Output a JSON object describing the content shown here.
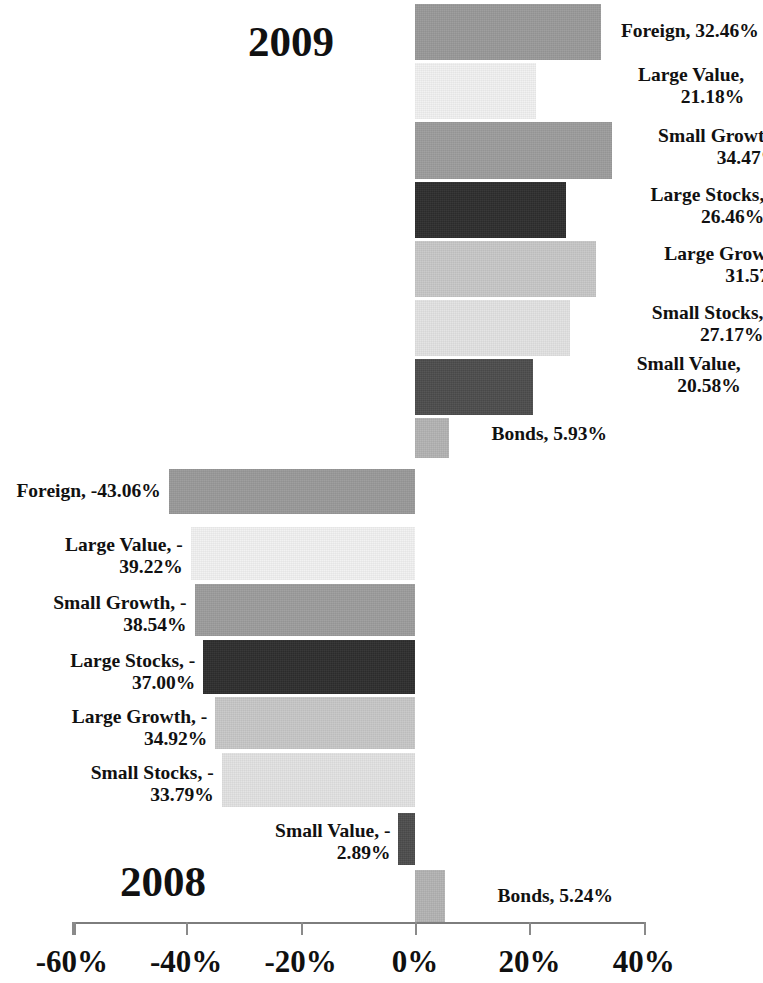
{
  "titles": {
    "top_year": "2009",
    "bottom_year": "2008"
  },
  "axis": {
    "tick_labels": [
      "-60%",
      "-40%",
      "-20%",
      "0%",
      "20%",
      "40%"
    ],
    "tick_values": [
      -60,
      -40,
      -20,
      0,
      20,
      40
    ]
  },
  "labels_2009": {
    "foreign": "Foreign, 32.46%",
    "large_value": "Large Value,\n21.18%",
    "small_growth": "Small Growth,\n34.47%",
    "large_stocks": "Large Stocks,\n26.46%",
    "large_growth": "Large Growth,\n31.57%",
    "small_stocks": "Small Stocks,\n27.17%",
    "small_value": "Small Value,\n20.58%",
    "bonds": "Bonds, 5.93%"
  },
  "labels_2008": {
    "foreign": "Foreign, -43.06%",
    "large_value": "Large Value, -\n39.22%",
    "small_growth": "Small Growth, -\n38.54%",
    "large_stocks": "Large Stocks, -\n37.00%",
    "large_growth": "Large Growth, -\n34.92%",
    "small_stocks": "Small Stocks, -\n33.79%",
    "small_value": "Small Value, -\n2.89%",
    "bonds": "Bonds, 5.24%"
  },
  "colors": {
    "foreign": "#9a9a9a",
    "large_value": "#f2f2f2",
    "small_growth": "#9d9d9d",
    "large_stocks": "#2e2e2e",
    "large_growth": "#c8c8c8",
    "small_stocks": "#e3e3e3",
    "small_value": "#4d4d4d",
    "bonds": "#b4b4b4",
    "axis": "#8a8a8a",
    "text": "#111111",
    "background": "#ffffff"
  },
  "chart_data": {
    "type": "bar",
    "title": "",
    "xlabel": "",
    "ylabel": "",
    "orientation": "horizontal",
    "xlim": [
      -60,
      40
    ],
    "xticks": [
      -60,
      -40,
      -20,
      0,
      20,
      40
    ],
    "xtick_labels": [
      "-60%",
      "-40%",
      "-20%",
      "0%",
      "20%",
      "40%"
    ],
    "grid": false,
    "legend": "none (labels attached to bars)",
    "groups": [
      {
        "name": "2009",
        "categories": [
          "Foreign",
          "Large Value",
          "Small Growth",
          "Large Stocks",
          "Large Growth",
          "Small Stocks",
          "Small Value",
          "Bonds"
        ],
        "values": [
          32.46,
          21.18,
          34.47,
          26.46,
          31.57,
          27.17,
          20.58,
          5.93
        ]
      },
      {
        "name": "2008",
        "categories": [
          "Foreign",
          "Large Value",
          "Small Growth",
          "Large Stocks",
          "Large Growth",
          "Small Stocks",
          "Small Value",
          "Bonds"
        ],
        "values": [
          -43.06,
          -39.22,
          -38.54,
          -37.0,
          -34.92,
          -33.79,
          -2.89,
          5.24
        ]
      }
    ]
  },
  "bars": [
    {
      "key": "b0",
      "group": "2009",
      "category": "Foreign",
      "value": 32.46,
      "top": 4,
      "height": 56,
      "color": "#9a9a9a",
      "label_key": "labels_2009.foreign",
      "label_side": "right",
      "label_top": 20,
      "label_width": 150
    },
    {
      "key": "b1",
      "group": "2009",
      "category": "Large Value",
      "value": 21.18,
      "top": 63,
      "height": 56,
      "color": "#f2f2f2",
      "label_key": "labels_2009.large_value",
      "label_side": "right",
      "label_top": 64,
      "label_width": 200
    },
    {
      "key": "b2",
      "group": "2009",
      "category": "Small Growth",
      "value": 34.47,
      "top": 122,
      "height": 57,
      "color": "#9d9d9d",
      "label_key": "labels_2009.small_growth",
      "label_side": "right",
      "label_top": 125,
      "label_width": 160
    },
    {
      "key": "b3",
      "group": "2009",
      "category": "Large Stocks",
      "value": 26.46,
      "top": 182,
      "height": 56,
      "color": "#2e2e2e",
      "label_key": "labels_2009.large_stocks",
      "label_side": "right",
      "label_top": 184,
      "label_width": 190
    },
    {
      "key": "b4",
      "group": "2009",
      "category": "Large Growth",
      "value": 31.57,
      "top": 241,
      "height": 56,
      "color": "#c8c8c8",
      "label_key": "labels_2009.large_growth",
      "label_side": "right",
      "label_top": 243,
      "label_width": 185
    },
    {
      "key": "b5",
      "group": "2009",
      "category": "Small Stocks",
      "value": 27.17,
      "top": 300,
      "height": 56,
      "color": "#e3e3e3",
      "label_key": "labels_2009.small_stocks",
      "label_side": "right",
      "label_top": 302,
      "label_width": 185
    },
    {
      "key": "b6",
      "group": "2009",
      "category": "Small Value",
      "value": 20.58,
      "top": 359,
      "height": 56,
      "color": "#4d4d4d",
      "label_key": "labels_2009.small_value",
      "label_side": "right",
      "label_top": 353,
      "label_width": 200
    },
    {
      "key": "b7",
      "group": "2009",
      "category": "Bonds",
      "value": 5.93,
      "top": 418,
      "height": 40,
      "color": "#b4b4b4",
      "label_key": "labels_2009.bonds",
      "label_side": "right",
      "label_top": 423,
      "label_width": 150
    },
    {
      "key": "b8",
      "group": "2008",
      "category": "Foreign",
      "value": -43.06,
      "top": 469,
      "height": 45,
      "color": "#9a9a9a",
      "label_key": "labels_2008.foreign",
      "label_side": "left",
      "label_top": 480,
      "label_width": 168
    },
    {
      "key": "b9",
      "group": "2008",
      "category": "Large Value",
      "value": -39.22,
      "top": 527,
      "height": 53,
      "color": "#f2f2f2",
      "label_key": "labels_2008.large_value",
      "label_side": "left",
      "label_top": 534,
      "label_width": 175
    },
    {
      "key": "b10",
      "group": "2008",
      "category": "Small Growth",
      "value": -38.54,
      "top": 584,
      "height": 52,
      "color": "#9d9d9d",
      "label_key": "labels_2008.small_growth",
      "label_side": "left",
      "label_top": 592,
      "label_width": 192
    },
    {
      "key": "b11",
      "group": "2008",
      "category": "Large Stocks",
      "value": -37.0,
      "top": 640,
      "height": 54,
      "color": "#2e2e2e",
      "label_key": "labels_2008.large_stocks",
      "label_side": "left",
      "label_top": 650,
      "label_width": 188
    },
    {
      "key": "b12",
      "group": "2008",
      "category": "Large Growth",
      "value": -34.92,
      "top": 697,
      "height": 52,
      "color": "#c8c8c8",
      "label_key": "labels_2008.large_growth",
      "label_side": "left",
      "label_top": 706,
      "label_width": 188
    },
    {
      "key": "b13",
      "group": "2008",
      "category": "Small Stocks",
      "value": -33.79,
      "top": 753,
      "height": 54,
      "color": "#e3e3e3",
      "label_key": "labels_2008.small_stocks",
      "label_side": "left",
      "label_top": 762,
      "label_width": 190
    },
    {
      "key": "b14",
      "group": "2008",
      "category": "Small Value",
      "value": -2.89,
      "top": 813,
      "height": 52,
      "color": "#4d4d4d",
      "label_key": "labels_2008.small_value",
      "label_side": "left",
      "label_top": 820,
      "label_width": 200
    },
    {
      "key": "b15",
      "group": "2008",
      "category": "Bonds",
      "value": 5.24,
      "top": 870,
      "height": 52,
      "color": "#b4b4b4",
      "label_key": "labels_2008.bonds",
      "label_side": "right",
      "label_top": 885,
      "label_width": 160
    }
  ]
}
